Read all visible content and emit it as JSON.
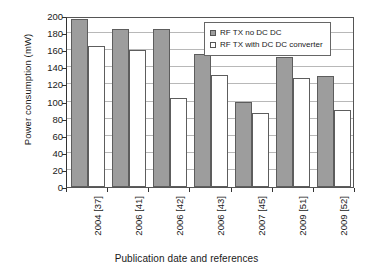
{
  "chart_data": {
    "type": "bar",
    "title": "",
    "xlabel": "Publication date and references",
    "ylabel": "Power consumption (mW)",
    "ylim": [
      0,
      200
    ],
    "ytick_step": 20,
    "yticks": [
      0,
      20,
      40,
      60,
      80,
      100,
      120,
      140,
      160,
      180,
      200
    ],
    "grid": true,
    "legend_position": "top-right",
    "categories": [
      "2004 [37]",
      "2006 [41]",
      "2006 [42]",
      "2006 [43]",
      "2007 [45]",
      "2009 [51]",
      "2009 [52]"
    ],
    "series": [
      {
        "name": "RF TX no DC DC",
        "color": "#9d9d9d",
        "values": [
          196,
          185,
          185,
          156,
          100,
          152,
          130
        ]
      },
      {
        "name": "RF TX with DC DC converter",
        "color": "#ffffff",
        "values": [
          165,
          160,
          104,
          131,
          87,
          128,
          90
        ]
      }
    ]
  },
  "legend": {
    "items": [
      {
        "label": "RF TX no DC DC",
        "swatch": "series-a"
      },
      {
        "label": "RF TX with DC DC converter",
        "swatch": "series-b"
      }
    ]
  },
  "colors": {
    "series_a_fill": "#9d9d9d",
    "series_b_fill": "#ffffff",
    "bar_outline": "#5d5d5d",
    "gridline": "#b8b8b8",
    "axis": "#333333",
    "background": "#ffffff",
    "text": "#1a1a1a"
  }
}
